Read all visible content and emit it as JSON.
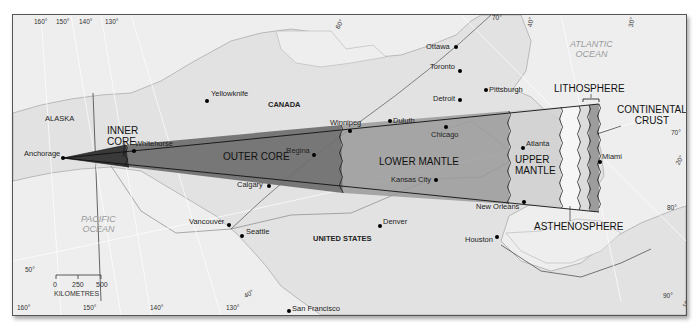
{
  "map": {
    "regions": {
      "alaska": "ALASKA",
      "canada": "CANADA",
      "united_states": "UNITED STATES"
    },
    "oceans": {
      "pacific": [
        "PACIFIC",
        "OCEAN"
      ],
      "atlantic": [
        "ATLANTIC",
        "OCEAN"
      ]
    },
    "cities": [
      {
        "name": "Yellowknife",
        "x": 206,
        "y": 98
      },
      {
        "name": "Ottawa",
        "x": 455,
        "y": 46
      },
      {
        "name": "Toronto",
        "x": 458,
        "y": 69
      },
      {
        "name": "Pittsburgh",
        "x": 482,
        "y": 89
      },
      {
        "name": "Detroit",
        "x": 457,
        "y": 98
      },
      {
        "name": "Winnipeg",
        "x": 348,
        "y": 128
      },
      {
        "name": "Duluth",
        "x": 387,
        "y": 120
      },
      {
        "name": "Chicago",
        "x": 444,
        "y": 125
      },
      {
        "name": "Anchorage",
        "x": 62,
        "y": 157
      },
      {
        "name": "Whitehorse",
        "x": 133,
        "y": 149
      },
      {
        "name": "Regina",
        "x": 312,
        "y": 153
      },
      {
        "name": "Atlanta",
        "x": 520,
        "y": 146
      },
      {
        "name": "Miami",
        "x": 598,
        "y": 159
      },
      {
        "name": "Calgary",
        "x": 267,
        "y": 184
      },
      {
        "name": "Kansas City",
        "x": 434,
        "y": 178
      },
      {
        "name": "New Orleans",
        "x": 522,
        "y": 200
      },
      {
        "name": "Vancouver",
        "x": 227,
        "y": 223
      },
      {
        "name": "Seattle",
        "x": 240,
        "y": 234
      },
      {
        "name": "Denver",
        "x": 378,
        "y": 224
      },
      {
        "name": "Houston",
        "x": 495,
        "y": 235
      },
      {
        "name": "San Francisco",
        "x": 287,
        "y": 308
      }
    ],
    "earth_layers": {
      "inner_core": [
        "INNER",
        "CORE"
      ],
      "outer_core": "OUTER CORE",
      "lower_mantle": "LOWER MANTLE",
      "upper_mantle": [
        "UPPER",
        "MANTLE"
      ],
      "asthenosphere": "ASTHENOSPHERE",
      "lithosphere": "LITHOSPHERE",
      "continental_crust": [
        "CONTINENTAL",
        "CRUST"
      ]
    },
    "layer_colors": {
      "inner_core": "#3a3a3a",
      "outer_core": "#6e6e6e",
      "lower_mantle": "#9a9a9a",
      "upper_mantle": "#c9c9c9",
      "asthenosphere": "#f4f4f4",
      "lithosphere": "#d8d8d8",
      "continental_crust": "#9c9c9c"
    },
    "graticule": {
      "top": [
        "160°",
        "150°",
        "140°",
        "130°",
        "60°",
        "70°",
        "40°",
        "30°"
      ],
      "bottom": [
        "160°",
        "150°",
        "140°",
        "130°",
        "90°"
      ],
      "left": [
        "50°"
      ],
      "right": [
        "70°",
        "80°",
        "90°"
      ],
      "inner": [
        "40°",
        "20°",
        "10°"
      ]
    },
    "scale_bar": {
      "ticks": [
        "0",
        "250",
        "500"
      ],
      "unit": "KILOMETRES"
    }
  }
}
